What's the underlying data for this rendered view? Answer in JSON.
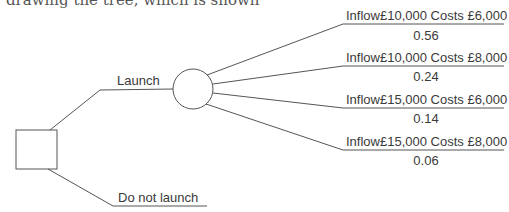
{
  "intro_text": "drawing the tree, which is shown",
  "decision_node": {
    "shape": "square"
  },
  "chance_node": {
    "shape": "circle"
  },
  "decisions": [
    {
      "label": "Launch"
    },
    {
      "label": "Do not launch"
    }
  ],
  "outcomes": [
    {
      "label": "Inflow£10,000 Costs £6,000",
      "probability": "0.56"
    },
    {
      "label": "Inflow£10,000 Costs £8,000",
      "probability": "0.24"
    },
    {
      "label": "Inflow£15,000 Costs £6,000",
      "probability": "0.14"
    },
    {
      "label": "Inflow£15,000 Costs £8,000",
      "probability": "0.06"
    }
  ],
  "colors": {
    "line": "#555555",
    "text": "#3a3a3a"
  }
}
